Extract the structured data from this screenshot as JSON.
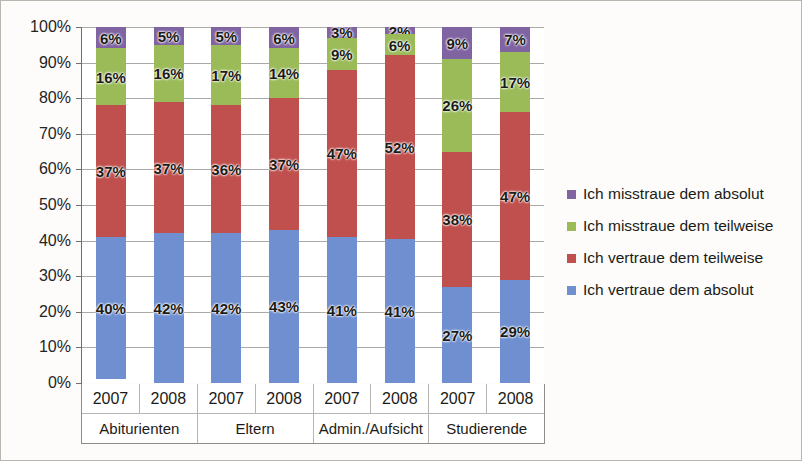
{
  "chart_data": {
    "type": "bar",
    "stacked": true,
    "stack_mode": "percent",
    "title": "",
    "subtitle": "",
    "xlabel": "",
    "ylabel": "",
    "ylim": [
      0,
      100
    ],
    "grid": true,
    "legend_position": "right",
    "ytick_labels": [
      "100%",
      "90%",
      "80%",
      "70%",
      "60%",
      "50%",
      "40%",
      "30%",
      "20%",
      "10%",
      "0%"
    ],
    "ytick_values": [
      100,
      90,
      80,
      70,
      60,
      50,
      40,
      30,
      20,
      10,
      0
    ],
    "groups": [
      {
        "label": "Abiturienten",
        "years": [
          "2007",
          "2008"
        ]
      },
      {
        "label": "Eltern",
        "years": [
          "2007",
          "2008"
        ]
      },
      {
        "label": "Admin./Aufsicht",
        "years": [
          "2007",
          "2008"
        ]
      },
      {
        "label": "Studierende",
        "years": [
          "2007",
          "2008"
        ]
      }
    ],
    "categories": [
      "2007",
      "2008",
      "2007",
      "2008",
      "2007",
      "2008",
      "2007",
      "2008"
    ],
    "series": [
      {
        "name": "Ich misstraue dem absolut",
        "color": "#8064a2",
        "values": [
          6,
          5,
          5,
          6,
          3,
          2,
          9,
          7
        ],
        "labels": [
          "6%",
          "5%",
          "5%",
          "6%",
          "3%",
          "2%",
          "9%",
          "7%"
        ]
      },
      {
        "name": "Ich misstraue dem teilweise",
        "color": "#9bbb59",
        "values": [
          16,
          16,
          17,
          14,
          9,
          6,
          26,
          17
        ],
        "labels": [
          "16%",
          "16%",
          "17%",
          "14%",
          "9%",
          "6%",
          "26%",
          "17%"
        ]
      },
      {
        "name": "Ich vertraue dem teilweise",
        "color": "#c0504d",
        "values": [
          37,
          37,
          36,
          37,
          47,
          52,
          38,
          47
        ],
        "labels": [
          "37%",
          "37%",
          "36%",
          "37%",
          "47%",
          "52%",
          "38%",
          "47%"
        ]
      },
      {
        "name": "Ich vertraue dem absolut",
        "color": "#6f8fd0",
        "values": [
          40,
          42,
          42,
          43,
          41,
          41,
          27,
          29
        ],
        "labels": [
          "40%",
          "42%",
          "42%",
          "43%",
          "41%",
          "41%",
          "27%",
          "29%"
        ]
      }
    ]
  },
  "legend": {
    "items": [
      {
        "label": "Ich misstraue dem absolut",
        "color": "#8064a2"
      },
      {
        "label": "Ich misstraue dem teilweise",
        "color": "#9bbb59"
      },
      {
        "label": "Ich vertraue dem teilweise",
        "color": "#c0504d"
      },
      {
        "label": "Ich vertraue dem absolut",
        "color": "#6f8fd0"
      }
    ]
  }
}
